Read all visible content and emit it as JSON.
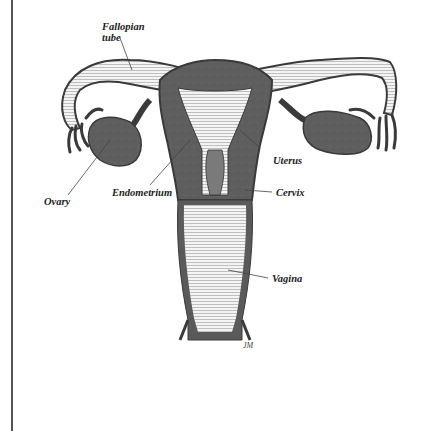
{
  "figure": {
    "colors": {
      "tissue": "#5c5c5c",
      "outline": "#3a3a3a",
      "light": "#f2f2f2",
      "line": "#555555",
      "background": "#ffffff"
    },
    "labels": {
      "fallopian_line1": "Fallopian",
      "fallopian_line2": "tube",
      "uterus": "Uterus",
      "endometrium": "Endometrium",
      "cervix": "Cervix",
      "ovary": "Ovary",
      "vagina": "Vagina"
    },
    "signature": "JM"
  }
}
